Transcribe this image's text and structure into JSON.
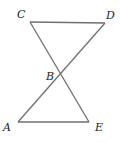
{
  "diagram": {
    "type": "geometry",
    "points": {
      "C": {
        "label": "C",
        "x": 30,
        "y": 22
      },
      "D": {
        "label": "D",
        "x": 105,
        "y": 23
      },
      "B": {
        "label": "B",
        "x": 60,
        "y": 74
      },
      "A": {
        "label": "A",
        "x": 18,
        "y": 122
      },
      "E": {
        "label": "E",
        "x": 89,
        "y": 122
      }
    },
    "segments": [
      "CD",
      "CE",
      "DA",
      "AE"
    ],
    "labels": {
      "C": "C",
      "D": "D",
      "B": "B",
      "A": "A",
      "E": "E"
    },
    "line_color": "#6f6f6f"
  }
}
